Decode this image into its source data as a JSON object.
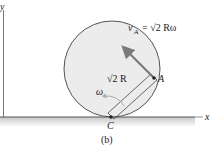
{
  "diagram": {
    "caption": "(b)",
    "axes": {
      "x_label": "x",
      "y_label": "y"
    },
    "points": {
      "A": "A",
      "C": "C"
    },
    "velocity_label": {
      "v": "v",
      "sub": "A",
      "eq": "= √2 Rω"
    },
    "radius_label": "√2 R",
    "omega_label": "ω",
    "colors": {
      "disk_fill": "#ececec",
      "disk_stroke": "#555555",
      "arrow": "#7a7a7a",
      "ground": "#888888"
    }
  }
}
